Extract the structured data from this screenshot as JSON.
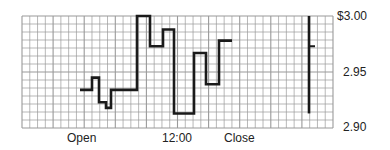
{
  "chart_data": {
    "type": "line",
    "subtype": "step",
    "title": "",
    "xlabel": "",
    "ylabel": "",
    "x_tick_labels": [
      "Open",
      "12:00",
      "Close"
    ],
    "y_tick_labels": [
      "$3.00",
      "2.95",
      "2.90"
    ],
    "ylim": [
      2.9,
      3.0
    ],
    "grid": true,
    "legend": null,
    "series": [
      {
        "name": "Intraday price",
        "style": "step",
        "points": [
          {
            "x": 80,
            "y": 2.934
          },
          {
            "x": 92,
            "y": 2.945
          },
          {
            "x": 99,
            "y": 2.923
          },
          {
            "x": 106,
            "y": 2.918
          },
          {
            "x": 111,
            "y": 2.934
          },
          {
            "x": 137,
            "y": 3.0
          },
          {
            "x": 150,
            "y": 2.973
          },
          {
            "x": 163,
            "y": 2.988
          },
          {
            "x": 174,
            "y": 2.913
          },
          {
            "x": 194,
            "y": 2.967
          },
          {
            "x": 206,
            "y": 2.939
          },
          {
            "x": 219,
            "y": 2.978
          },
          {
            "x": 232,
            "y": 2.978
          }
        ]
      }
    ],
    "summary_bar": {
      "high": 3.0,
      "low": 2.913,
      "close": 2.973
    }
  },
  "labels": {
    "open": "Open",
    "noon": "12:00",
    "close": "Close",
    "y_top": "$3.00",
    "y_mid": "2.95",
    "y_bottom": "2.90"
  },
  "layout": {
    "plot": {
      "x0": 22,
      "x1": 333,
      "y0": 16,
      "y1": 128
    },
    "minor_cell": 7.8,
    "bar_x": 309,
    "grid_color": "#9a9a9a",
    "line_color": "#1a1a1a"
  }
}
